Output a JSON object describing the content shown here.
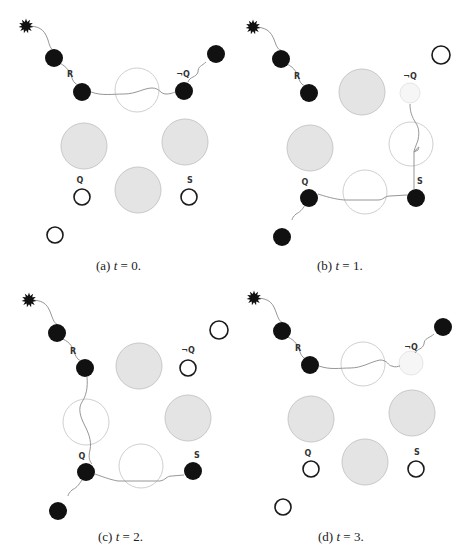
{
  "figure": {
    "colors": {
      "filled": "#111111",
      "gray_fill": "#e4e4e4",
      "gray_stroke": "#c8c8c8",
      "open_stroke": "#cfcfcf",
      "ring_stroke": "#1a1a1a",
      "faint_fill": "#f6f6f6",
      "faint_stroke": "#e6e6e6",
      "wire": "#8a8a8a"
    },
    "panels": [
      {
        "id": "a",
        "caption_prefix": "(a)",
        "caption_var": "t",
        "caption_value": "= 0.",
        "caption_pos": [
          96,
          270
        ],
        "star": [
          26,
          26
        ],
        "nodes": [
          {
            "kind": "filled",
            "x": 54,
            "y": 58,
            "r": 9
          },
          {
            "kind": "filled",
            "x": 82,
            "y": 92,
            "r": 9
          },
          {
            "kind": "open_big",
            "x": 137,
            "y": 90,
            "r": 22
          },
          {
            "kind": "filled",
            "x": 184,
            "y": 91,
            "r": 9
          },
          {
            "kind": "filled",
            "x": 216,
            "y": 54,
            "r": 9
          },
          {
            "kind": "gray",
            "x": 84,
            "y": 146,
            "r": 23
          },
          {
            "kind": "gray",
            "x": 185,
            "y": 142,
            "r": 23
          },
          {
            "kind": "gray",
            "x": 138,
            "y": 190,
            "r": 23
          },
          {
            "kind": "ring",
            "x": 82,
            "y": 197,
            "r": 8
          },
          {
            "kind": "ring",
            "x": 189,
            "y": 197,
            "r": 8
          },
          {
            "kind": "ring",
            "x": 55,
            "y": 235,
            "r": 8
          }
        ],
        "labels": [
          {
            "text": "R",
            "x": 70,
            "y": 77
          },
          {
            "text": "¬Q",
            "x": 183,
            "y": 77
          },
          {
            "text": "Q",
            "x": 80,
            "y": 183
          },
          {
            "text": "S",
            "x": 190,
            "y": 183
          }
        ],
        "wires": [
          "M26,26 C38,26 44,28 48,40 C50,48 52,50 54,50",
          "M60,63 C68,68 70,72 72,78 C74,84 78,86 82,84",
          "M91,92 C102,96 112,94 124,94 C136,94 144,88 152,88 C160,88 160,94 166,94 C172,94 174,92 176,92",
          "M188,82 C190,76 196,78 198,72 C198,66 202,66 206,62"
        ]
      },
      {
        "id": "b",
        "caption_prefix": "(b)",
        "caption_var": "t",
        "caption_value": "= 1.",
        "caption_pos": [
          317,
          270
        ],
        "star": [
          253,
          27
        ],
        "nodes": [
          {
            "kind": "filled",
            "x": 281,
            "y": 59,
            "r": 9
          },
          {
            "kind": "filled",
            "x": 309,
            "y": 93,
            "r": 9
          },
          {
            "kind": "gray",
            "x": 362,
            "y": 92,
            "r": 23
          },
          {
            "kind": "faint",
            "x": 410,
            "y": 93,
            "r": 10
          },
          {
            "kind": "ring",
            "x": 441,
            "y": 55,
            "r": 9
          },
          {
            "kind": "gray",
            "x": 310,
            "y": 148,
            "r": 23
          },
          {
            "kind": "open_big",
            "x": 411,
            "y": 144,
            "r": 22
          },
          {
            "kind": "open_big",
            "x": 365,
            "y": 192,
            "r": 22
          },
          {
            "kind": "filled",
            "x": 309,
            "y": 198,
            "r": 9
          },
          {
            "kind": "filled",
            "x": 416,
            "y": 198,
            "r": 9
          },
          {
            "kind": "filled",
            "x": 282,
            "y": 237,
            "r": 9
          }
        ],
        "labels": [
          {
            "text": "R",
            "x": 297,
            "y": 79
          },
          {
            "text": "¬Q",
            "x": 410,
            "y": 79
          },
          {
            "text": "Q",
            "x": 305,
            "y": 185
          },
          {
            "text": "S",
            "x": 420,
            "y": 184
          }
        ],
        "wires": [
          "M253,27 C265,27 271,30 275,42 C277,48 279,50 281,50",
          "M287,64 C295,68 297,73 299,79 C301,85 305,87 309,85",
          "M410,104 C410,112 412,116 414,120 C418,126 420,130 418,140 C416,146 414,150 414,152 C418,148 420,144 418,150 L414,152 L414,189",
          "M318,194 C330,198 340,200 346,200 L378,200 C384,200 384,196 390,196 L407,195",
          "M305,205 C302,210 300,212 296,214 C294,216 292,218 292,220"
        ]
      },
      {
        "id": "c",
        "caption_prefix": "(c)",
        "caption_var": "t",
        "caption_value": "= 2.",
        "caption_pos": [
          98,
          541
        ],
        "star": [
          29,
          300
        ],
        "nodes": [
          {
            "kind": "filled",
            "x": 57,
            "y": 333,
            "r": 9
          },
          {
            "kind": "filled",
            "x": 85,
            "y": 368,
            "r": 9
          },
          {
            "kind": "gray",
            "x": 139,
            "y": 366,
            "r": 23
          },
          {
            "kind": "ring",
            "x": 188,
            "y": 368,
            "r": 8
          },
          {
            "kind": "ring",
            "x": 219,
            "y": 330,
            "r": 9
          },
          {
            "kind": "open_big",
            "x": 86,
            "y": 422,
            "r": 23
          },
          {
            "kind": "gray",
            "x": 188,
            "y": 418,
            "r": 23
          },
          {
            "kind": "open_big",
            "x": 141,
            "y": 466,
            "r": 22
          },
          {
            "kind": "filled",
            "x": 86,
            "y": 472,
            "r": 9
          },
          {
            "kind": "filled",
            "x": 193,
            "y": 471,
            "r": 9
          },
          {
            "kind": "filled",
            "x": 58,
            "y": 511,
            "r": 9
          }
        ],
        "labels": [
          {
            "text": "R",
            "x": 73,
            "y": 354
          },
          {
            "text": "¬Q",
            "x": 188,
            "y": 353
          },
          {
            "text": "Q",
            "x": 82,
            "y": 459
          },
          {
            "text": "S",
            "x": 197,
            "y": 458
          }
        ],
        "wires": [
          "M29,300 C41,300 47,302 51,314 C53,320 55,324 57,324",
          "M63,339 C71,343 73,348 75,354 C77,360 81,362 85,360",
          "M87,377 C88,388 86,396 82,402 C78,408 80,416 84,424 C88,432 92,440 90,450 C88,458 90,462 92,464",
          "M95,474 C106,478 112,480 118,481 L160,481 C166,480 166,476 172,476 L184,475",
          "M82,480 C78,486 76,488 72,490 C70,492 68,494 68,496"
        ]
      },
      {
        "id": "d",
        "caption_prefix": "(d)",
        "caption_var": "t",
        "caption_value": "= 3.",
        "caption_pos": [
          318,
          541
        ],
        "star": [
          254,
          298
        ],
        "nodes": [
          {
            "kind": "filled",
            "x": 282,
            "y": 331,
            "r": 9
          },
          {
            "kind": "filled",
            "x": 310,
            "y": 365,
            "r": 9
          },
          {
            "kind": "open_big",
            "x": 363,
            "y": 364,
            "r": 22
          },
          {
            "kind": "faint",
            "x": 411,
            "y": 363,
            "r": 12
          },
          {
            "kind": "filled",
            "x": 443,
            "y": 327,
            "r": 9
          },
          {
            "kind": "gray",
            "x": 311,
            "y": 419,
            "r": 23
          },
          {
            "kind": "gray",
            "x": 412,
            "y": 413,
            "r": 23
          },
          {
            "kind": "gray",
            "x": 365,
            "y": 462,
            "r": 23
          },
          {
            "kind": "ring",
            "x": 311,
            "y": 469,
            "r": 8
          },
          {
            "kind": "ring",
            "x": 416,
            "y": 469,
            "r": 8
          },
          {
            "kind": "ring",
            "x": 283,
            "y": 507,
            "r": 8
          }
        ],
        "labels": [
          {
            "text": "R",
            "x": 298,
            "y": 351
          },
          {
            "text": "¬Q",
            "x": 411,
            "y": 350
          },
          {
            "text": "Q",
            "x": 308,
            "y": 456
          },
          {
            "text": "S",
            "x": 417,
            "y": 455
          }
        ],
        "wires": [
          "M254,298 C266,298 272,300 276,312 C278,318 280,322 282,322",
          "M288,337 C296,341 298,346 300,352 C302,358 306,360 310,358",
          "M319,366 C330,370 340,368 350,368 C362,368 370,362 380,360 C388,360 388,366 392,366 C396,368 398,366 400,366",
          "M415,353 C418,348 422,350 424,344 C424,338 430,338 434,334"
        ]
      }
    ]
  }
}
